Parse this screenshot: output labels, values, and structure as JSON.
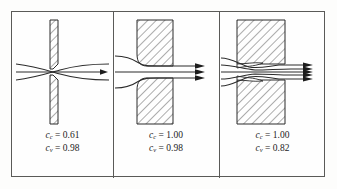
{
  "figure": {
    "panel_count": 3,
    "line_color": "#2b2b2b",
    "frame_color": "#5a5a58",
    "hatch_color": "#4a4a4a",
    "background": "#fefefe"
  },
  "panels": [
    {
      "id": "panel-sharp-edged-orifice",
      "geometry": "sharp-edged thin-plate orifice",
      "plate_style": "thin vertical hatched bar",
      "streamline_count": 3,
      "exit_arrow_count": 1,
      "has_vena_contracta": true,
      "has_separation_bubble": false,
      "coefficients": [
        {
          "symbol": "c",
          "subscript": "c",
          "equals": "=",
          "value": "0.61"
        },
        {
          "symbol": "c",
          "subscript": "v",
          "equals": "=",
          "value": "0.98"
        }
      ]
    },
    {
      "id": "panel-rounded-bellmouth-nozzle",
      "geometry": "rounded bellmouth entry nozzle",
      "plate_style": "thick hatched block with rounded inlet fillet",
      "streamline_count": 3,
      "exit_arrow_count": 3,
      "has_vena_contracta": false,
      "has_separation_bubble": false,
      "coefficients": [
        {
          "symbol": "c",
          "subscript": "c",
          "equals": "=",
          "value": "1.00"
        },
        {
          "symbol": "c",
          "subscript": "v",
          "equals": "=",
          "value": "0.98"
        }
      ]
    },
    {
      "id": "panel-square-edged-entry",
      "geometry": "square-edged re-entrant duct with separation bubbles",
      "plate_style": "large hatched block with square inlet corner",
      "streamline_count": 5,
      "exit_arrow_count": 5,
      "has_vena_contracta": false,
      "has_separation_bubble": true,
      "coefficients": [
        {
          "symbol": "c",
          "subscript": "c",
          "equals": "=",
          "value": "1.00"
        },
        {
          "symbol": "c",
          "subscript": "v",
          "equals": "=",
          "value": "0.82"
        }
      ]
    }
  ]
}
